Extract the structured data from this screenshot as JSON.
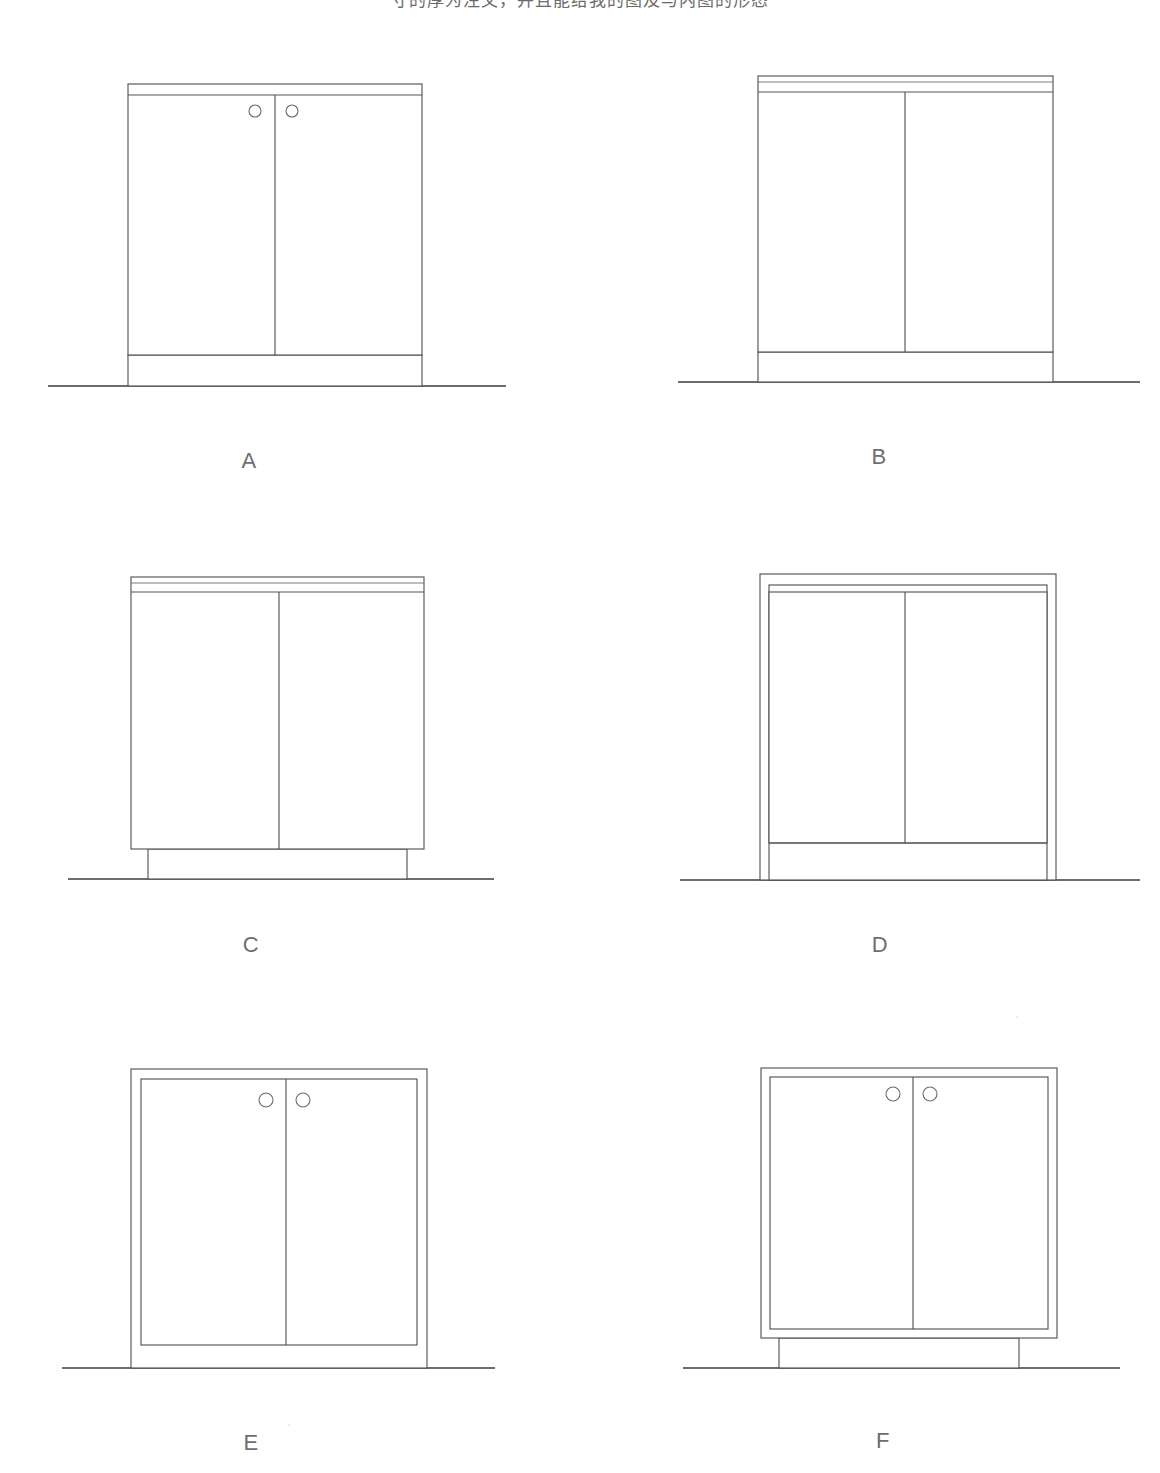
{
  "page": {
    "caption": "寸的厚为注文，并且能给我的图及与内图的形态",
    "background_color": "#ffffff",
    "line_color": "#555555",
    "floor_line_color": "#3c3c3c",
    "label_color": "#6e6e6e",
    "drawing_type": "furniture elevation line drawings",
    "figure_count": 6
  },
  "figures": [
    {
      "id": "A",
      "label": "A",
      "door_count": 2,
      "has_knobs": true,
      "knob_count": 2,
      "top_band": "single",
      "top_band_lines": 2,
      "door_style": "overlay",
      "base_style": "flush-plinth",
      "carcass_frame_visible": false,
      "box": {
        "x": 128,
        "y": 84,
        "w": 294,
        "h": 271
      },
      "top_band_y": [
        84,
        95
      ],
      "base_band_y": [
        355,
        386
      ],
      "door_split_x": 275,
      "floor": {
        "x1": 48,
        "x2": 506,
        "y": 386
      },
      "knobs": [
        {
          "cx": 255,
          "cy": 111,
          "r": 6
        },
        {
          "cx": 292,
          "cy": 111,
          "r": 6
        }
      ],
      "label_pos": {
        "x": 249,
        "y": 448
      }
    },
    {
      "id": "B",
      "label": "B",
      "door_count": 2,
      "has_knobs": false,
      "knob_count": 0,
      "top_band": "double",
      "top_band_lines": 3,
      "door_style": "overlay",
      "base_style": "flush-plinth",
      "carcass_frame_visible": false,
      "box": {
        "x": 758,
        "y": 76,
        "w": 295,
        "h": 280
      },
      "top_band_y": [
        76,
        82,
        92
      ],
      "base_band_y": [
        352,
        382
      ],
      "door_split_x": 905,
      "floor": {
        "x1": 678,
        "x2": 1140,
        "y": 382
      },
      "knobs": [],
      "label_pos": {
        "x": 879,
        "y": 444
      }
    },
    {
      "id": "C",
      "label": "C",
      "door_count": 2,
      "has_knobs": false,
      "knob_count": 0,
      "top_band": "double",
      "top_band_lines": 3,
      "door_style": "overlay",
      "base_style": "recessed-plinth",
      "carcass_frame_visible": false,
      "box": {
        "x": 131,
        "y": 577,
        "w": 293,
        "h": 272
      },
      "top_band_y": [
        577,
        583,
        592
      ],
      "base_band_y": [
        849,
        879
      ],
      "plinth_inset": 17,
      "door_split_x": 279,
      "floor": {
        "x1": 68,
        "x2": 494,
        "y": 879
      },
      "knobs": [],
      "label_pos": {
        "x": 251,
        "y": 932
      }
    },
    {
      "id": "D",
      "label": "D",
      "door_count": 2,
      "has_knobs": false,
      "knob_count": 0,
      "top_band": "frame",
      "top_band_lines": 2,
      "door_style": "inset",
      "base_style": "toe-kick",
      "carcass_frame_visible": true,
      "box": {
        "x": 760,
        "y": 574,
        "w": 296,
        "h": 312
      },
      "frame_thickness": 9,
      "toe_kick_y": 843,
      "door_split_x": 905,
      "floor": {
        "x1": 680,
        "x2": 1140,
        "y": 880
      },
      "knobs": [],
      "label_pos": {
        "x": 880,
        "y": 932
      }
    },
    {
      "id": "E",
      "label": "E",
      "door_count": 2,
      "has_knobs": true,
      "knob_count": 2,
      "top_band": "frame",
      "top_band_lines": 2,
      "door_style": "inset",
      "base_style": "open-base",
      "carcass_frame_visible": true,
      "box": {
        "x": 131,
        "y": 1069,
        "w": 296,
        "h": 299
      },
      "frame_thickness": 8,
      "door_bottom_y": 1345,
      "door_split_x": 286,
      "floor": {
        "x1": 62,
        "x2": 495,
        "y": 1368
      },
      "knobs": [
        {
          "cx": 266,
          "cy": 1100,
          "r": 7
        },
        {
          "cx": 303,
          "cy": 1100,
          "r": 7
        }
      ],
      "label_pos": {
        "x": 251,
        "y": 1430
      }
    },
    {
      "id": "F",
      "label": "F",
      "door_count": 2,
      "has_knobs": true,
      "knob_count": 2,
      "top_band": "frame",
      "top_band_lines": 2,
      "door_style": "inset",
      "base_style": "recessed-plinth",
      "carcass_frame_visible": true,
      "box": {
        "x": 761,
        "y": 1068,
        "w": 296,
        "h": 270
      },
      "frame_thickness": 8,
      "plinth_y": [
        1338,
        1368
      ],
      "plinth_inset": 18,
      "door_split_x": 913,
      "floor": {
        "x1": 683,
        "x2": 1120,
        "y": 1368
      },
      "knobs": [
        {
          "cx": 893,
          "cy": 1094,
          "r": 7
        },
        {
          "cx": 930,
          "cy": 1094,
          "r": 7
        }
      ],
      "label_pos": {
        "x": 883,
        "y": 1428
      }
    }
  ]
}
